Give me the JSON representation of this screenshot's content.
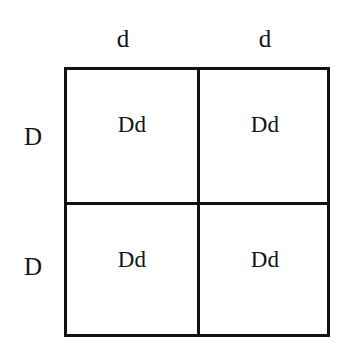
{
  "diagram": {
    "type": "punnett-square",
    "background_color": "#ffffff",
    "line_color": "#111111",
    "text_color": "#151515",
    "grid": {
      "rows": 2,
      "columns": 2
    },
    "column_headers": [
      {
        "label": "d"
      },
      {
        "label": "d"
      }
    ],
    "row_headers": [
      {
        "label": "D"
      },
      {
        "label": "D"
      }
    ],
    "cells": [
      [
        {
          "label": "Dd"
        },
        {
          "label": "Dd"
        }
      ],
      [
        {
          "label": "Dd"
        },
        {
          "label": "Dd"
        }
      ]
    ]
  }
}
